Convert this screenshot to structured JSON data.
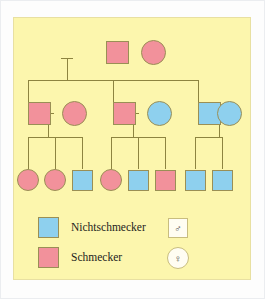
{
  "diagram": {
    "type": "pedigree",
    "panel_background": "#fcf6ad",
    "colors": {
      "taster_pink": "#f2919b",
      "nontaster_blue": "#8ed0ee",
      "line": "#8d8440",
      "symbol_border": "#9a8f55"
    },
    "generations": [
      {
        "id": "I",
        "individuals": [
          {
            "id": "I-1",
            "sex": "male",
            "shape": "square",
            "phenotype": "Schmecker",
            "color": "#f2919b",
            "x": 105,
            "y": 28
          },
          {
            "id": "I-2",
            "sex": "female",
            "shape": "circle",
            "phenotype": "Schmecker",
            "color": "#f2919b",
            "x": 140,
            "y": 27
          }
        ]
      },
      {
        "id": "II",
        "individuals": [
          {
            "id": "II-1",
            "sex": "male",
            "shape": "square",
            "phenotype": "Schmecker",
            "color": "#f2919b",
            "x": 27,
            "y": 101
          },
          {
            "id": "II-2",
            "sex": "female",
            "shape": "circle",
            "phenotype": "Schmecker",
            "color": "#f2919b",
            "x": 62,
            "y": 100
          },
          {
            "id": "II-3",
            "sex": "male",
            "shape": "square",
            "phenotype": "Schmecker",
            "color": "#f2919b",
            "x": 112,
            "y": 101
          },
          {
            "id": "II-4",
            "sex": "female",
            "shape": "circle",
            "phenotype": "Nichtschmecker",
            "color": "#8ed0ee",
            "x": 147,
            "y": 100
          },
          {
            "id": "II-5",
            "sex": "male",
            "shape": "square",
            "phenotype": "Nichtschmecker",
            "color": "#8ed0ee",
            "x": 183,
            "y": 101
          },
          {
            "id": "II-6",
            "sex": "female",
            "shape": "circle",
            "phenotype": "Nichtschmecker",
            "color": "#8ed0ee",
            "x": 216,
            "y": 100
          }
        ]
      },
      {
        "id": "III",
        "individuals": [
          {
            "id": "III-1",
            "sex": "female",
            "shape": "circle",
            "phenotype": "Schmecker",
            "color": "#f2919b",
            "x": 22,
            "y": 168
          },
          {
            "id": "III-2",
            "sex": "female",
            "shape": "circle",
            "phenotype": "Schmecker",
            "color": "#f2919b",
            "x": 49,
            "y": 168
          },
          {
            "id": "III-3",
            "sex": "male",
            "shape": "square",
            "phenotype": "Nichtschmecker",
            "color": "#8ed0ee",
            "x": 76,
            "y": 169
          },
          {
            "id": "III-4",
            "sex": "female",
            "shape": "circle",
            "phenotype": "Schmecker",
            "color": "#f2919b",
            "x": 105,
            "y": 168
          },
          {
            "id": "III-5",
            "sex": "male",
            "shape": "square",
            "phenotype": "Nichtschmecker",
            "color": "#8ed0ee",
            "x": 132,
            "y": 169
          },
          {
            "id": "III-6",
            "sex": "male",
            "shape": "square",
            "phenotype": "Schmecker",
            "color": "#f2919b",
            "x": 159,
            "y": 169
          },
          {
            "id": "III-7",
            "sex": "male",
            "shape": "square",
            "phenotype": "Nichtschmecker",
            "color": "#8ed0ee",
            "x": 189,
            "y": 169
          },
          {
            "id": "III-8",
            "sex": "male",
            "shape": "square",
            "phenotype": "Nichtschmecker",
            "color": "#8ed0ee",
            "x": 216,
            "y": 169
          }
        ]
      }
    ]
  },
  "legend": {
    "items": [
      {
        "label": "Nichtschmecker",
        "color": "#8ed0ee"
      },
      {
        "label": "Schmecker",
        "color": "#f2919b"
      }
    ],
    "sex_symbols": [
      {
        "name": "male-symbol",
        "glyph": "♂",
        "shape": "square"
      },
      {
        "name": "female-symbol",
        "glyph": "♀",
        "shape": "circle"
      }
    ]
  }
}
